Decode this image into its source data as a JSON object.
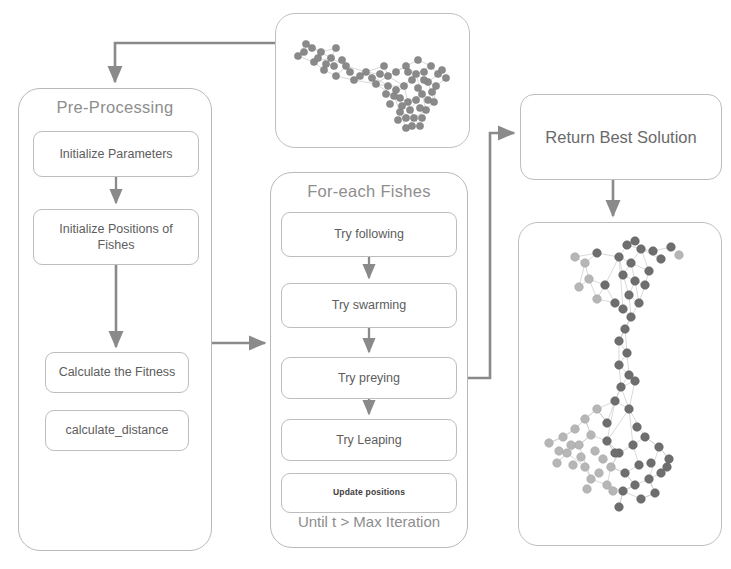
{
  "diagram": {
    "accent_color": "#7f7f7f",
    "border_color": "#bdbdbd",
    "text_color": "#5d5d5d"
  },
  "preprocessing": {
    "title": "Pre-Processing",
    "steps": [
      {
        "label": "Initialize Parameters"
      },
      {
        "label": "Initialize Positions of Fishes"
      },
      {
        "label": "Calculate the Fitness"
      },
      {
        "label": "calculate_distance"
      }
    ]
  },
  "foreach": {
    "title": "For-each Fishes",
    "steps": [
      {
        "label": "Try following"
      },
      {
        "label": "Try swarming"
      },
      {
        "label": "Try preying"
      },
      {
        "label": "Try Leaping"
      },
      {
        "label": "Update positions"
      }
    ],
    "loop_condition": "Until t > Max Iteration"
  },
  "result": {
    "label": "Return Best Solution"
  },
  "graphs": {
    "input": {
      "name": "input-network-graph",
      "node_color": "#8a8a8a",
      "edge_color": "#c2c2c2",
      "node_count": 74,
      "description": "Unclustered input network"
    },
    "output": {
      "name": "clustered-network-graph",
      "edge_color": "#c2c2c2",
      "cluster_colors": [
        "#6e6e6e",
        "#b4b4b4"
      ],
      "node_count": 78,
      "description": "Network partitioned into two communities"
    }
  },
  "connectors": [
    {
      "name": "input-graph-to-preprocessing"
    },
    {
      "name": "preprocessing-to-foreach"
    },
    {
      "name": "try-preying-to-result"
    },
    {
      "name": "result-to-output-graph"
    }
  ]
}
